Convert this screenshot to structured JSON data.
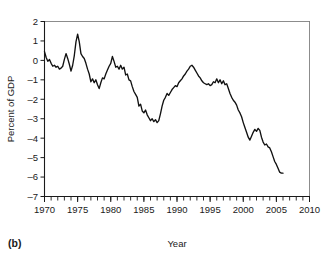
{
  "figure": {
    "panel_label": "(b)",
    "background_color": "#ffffff",
    "line_color": "#111111",
    "axis_color": "#1a1a1a"
  },
  "chart_data": {
    "type": "line",
    "title": "",
    "subtitle": "",
    "xlabel": "Year",
    "ylabel": "Percent of GDP",
    "xlim": [
      1970,
      2010
    ],
    "ylim": [
      -7,
      2
    ],
    "grid": false,
    "legend": "none",
    "x_major_ticks": [
      1970,
      1975,
      1980,
      1985,
      1990,
      1995,
      2000,
      2005,
      2010
    ],
    "x_tick_labels": [
      "1970",
      "1975",
      "1980",
      "1985",
      "1990",
      "1995",
      "2000",
      "2005",
      "2010"
    ],
    "x_minor_tick_interval": 1,
    "y_major_ticks": [
      2,
      1,
      0,
      -1,
      -2,
      -3,
      -4,
      -5,
      -6,
      -7
    ],
    "y_tick_labels": [
      "2",
      "1",
      "0",
      "-1",
      "-2",
      "-3",
      "-4",
      "-5",
      "-6",
      "-7"
    ],
    "series": [
      {
        "name": "Federal budget surplus/deficit",
        "x": [
          1970.0,
          1970.25,
          1970.5,
          1970.75,
          1971.0,
          1971.25,
          1971.5,
          1971.75,
          1972.0,
          1972.25,
          1972.5,
          1972.75,
          1973.0,
          1973.25,
          1973.5,
          1973.75,
          1974.0,
          1974.25,
          1974.5,
          1974.75,
          1975.0,
          1975.25,
          1975.5,
          1975.75,
          1976.0,
          1976.25,
          1976.5,
          1976.75,
          1977.0,
          1977.25,
          1977.5,
          1977.75,
          1978.0,
          1978.25,
          1978.5,
          1978.75,
          1979.0,
          1979.25,
          1979.5,
          1979.75,
          1980.0,
          1980.25,
          1980.5,
          1980.75,
          1981.0,
          1981.25,
          1981.5,
          1981.75,
          1982.0,
          1982.25,
          1982.5,
          1982.75,
          1983.0,
          1983.25,
          1983.5,
          1983.75,
          1984.0,
          1984.25,
          1984.5,
          1984.75,
          1985.0,
          1985.25,
          1985.5,
          1985.75,
          1986.0,
          1986.25,
          1986.5,
          1986.75,
          1987.0,
          1987.25,
          1987.5,
          1987.75,
          1988.0,
          1988.25,
          1988.5,
          1988.75,
          1989.0,
          1989.25,
          1989.5,
          1989.75,
          1990.0,
          1990.25,
          1990.5,
          1990.75,
          1991.0,
          1991.25,
          1991.5,
          1991.75,
          1992.0,
          1992.25,
          1992.5,
          1992.75,
          1993.0,
          1993.25,
          1993.5,
          1993.75,
          1994.0,
          1994.25,
          1994.5,
          1994.75,
          1995.0,
          1995.25,
          1995.5,
          1995.75,
          1996.0,
          1996.25,
          1996.5,
          1996.75,
          1997.0,
          1997.25,
          1997.5,
          1997.75,
          1998.0,
          1998.25,
          1998.5,
          1998.75,
          1999.0,
          1999.25,
          1999.5,
          1999.75,
          2000.0,
          2000.25,
          2000.5,
          2000.75,
          2001.0,
          2001.25,
          2001.5,
          2001.75,
          2002.0,
          2002.25,
          2002.5,
          2002.75,
          2003.0,
          2003.25,
          2003.5,
          2003.75,
          2004.0,
          2004.25,
          2004.5,
          2004.75,
          2005.0,
          2005.25,
          2005.5,
          2005.75,
          2006.0
        ],
        "y": [
          0.45,
          0.15,
          -0.05,
          0.05,
          -0.15,
          -0.3,
          -0.25,
          -0.35,
          -0.3,
          -0.45,
          -0.4,
          -0.3,
          0.05,
          0.35,
          0.1,
          -0.2,
          -0.55,
          -0.25,
          0.25,
          0.95,
          1.35,
          0.95,
          0.35,
          0.2,
          0.1,
          -0.15,
          -0.45,
          -0.7,
          -1.1,
          -0.95,
          -1.15,
          -1.0,
          -1.25,
          -1.45,
          -1.15,
          -0.9,
          -0.95,
          -0.7,
          -0.5,
          -0.3,
          -0.15,
          0.2,
          -0.05,
          -0.35,
          -0.3,
          -0.45,
          -0.25,
          -0.45,
          -0.35,
          -0.75,
          -0.7,
          -1.0,
          -1.05,
          -1.35,
          -1.6,
          -1.75,
          -1.9,
          -2.35,
          -2.25,
          -2.6,
          -2.7,
          -2.55,
          -2.8,
          -2.95,
          -3.1,
          -3.0,
          -3.15,
          -3.05,
          -3.2,
          -3.1,
          -2.75,
          -2.35,
          -2.05,
          -1.9,
          -1.7,
          -1.8,
          -1.65,
          -1.5,
          -1.4,
          -1.3,
          -1.35,
          -1.15,
          -1.05,
          -0.95,
          -0.8,
          -0.7,
          -0.55,
          -0.45,
          -0.3,
          -0.25,
          -0.35,
          -0.5,
          -0.65,
          -0.8,
          -0.9,
          -1.05,
          -1.15,
          -1.2,
          -1.25,
          -1.2,
          -1.3,
          -1.25,
          -1.1,
          -1.15,
          -0.95,
          -1.15,
          -1.0,
          -1.2,
          -1.05,
          -1.25,
          -1.2,
          -1.45,
          -1.7,
          -1.9,
          -2.05,
          -2.15,
          -2.3,
          -2.55,
          -2.7,
          -2.9,
          -3.2,
          -3.45,
          -3.7,
          -3.95,
          -4.1,
          -3.9,
          -3.7,
          -3.55,
          -3.65,
          -3.5,
          -3.6,
          -3.95,
          -4.2,
          -4.35,
          -4.3,
          -4.45,
          -4.5,
          -4.7,
          -4.95,
          -5.2,
          -5.35,
          -5.55,
          -5.75,
          -5.8,
          -5.8
        ]
      }
    ]
  }
}
